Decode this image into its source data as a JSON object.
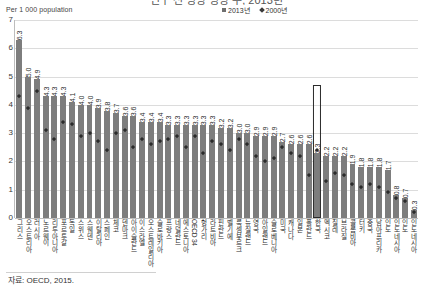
{
  "title_clipped": "인구 천 명당 병상 수, 2013년",
  "axis_unit_label": "Per 1 000 population",
  "legend": {
    "items": [
      {
        "label": "2013년",
        "marker": "square-swatch",
        "color": "#6f6f6f"
      },
      {
        "label": "2000년",
        "marker": "diamond-swatch",
        "color": "#3a3a3a"
      }
    ]
  },
  "source": "자료: OECD, 2015.",
  "highlight": {
    "category": "한국",
    "value": 2.3
  },
  "chart_data": {
    "type": "bar",
    "title": "인구 천 명당 병상 수, 2013년",
    "xlabel": "",
    "ylabel": "Per 1 000 population",
    "ylim": [
      0,
      7
    ],
    "yticks": [
      0,
      1,
      2,
      3,
      4,
      5,
      6,
      7
    ],
    "grid": true,
    "legend_position": "top-center",
    "categories": [
      "그리스",
      "오스트리아",
      "러시아",
      "노르웨이",
      "리투아니아",
      "포르투갈",
      "독일",
      "스위스",
      "스웨덴",
      "이탈리아",
      "스페인",
      "체코",
      "덴마크",
      "아이슬란드",
      "이스라엘",
      "오스트레일리아",
      "슬로바키아",
      "프랑스",
      "네덜란드",
      "에스토니아",
      "OECD 34",
      "헝가리",
      "라트비아",
      "핀란드",
      "벨기에",
      "룩셈부르크",
      "뉴질랜드",
      "영국",
      "아일랜드",
      "슬로베니아",
      "미국",
      "캐나다",
      "일본",
      "폴란드",
      "한국",
      "멕시코",
      "칠레",
      "브라질",
      "콜롬비아",
      "터키",
      "중국",
      "남아프리카",
      "인도",
      "인도네시아"
    ],
    "series": [
      {
        "name": "2013년",
        "type": "bar",
        "color": "#7d7d7d",
        "values": [
          6.3,
          5.0,
          4.9,
          4.3,
          4.3,
          4.3,
          4.1,
          4.0,
          4.0,
          3.9,
          3.8,
          3.7,
          3.6,
          3.6,
          3.4,
          3.4,
          3.4,
          3.3,
          3.3,
          3.3,
          3.3,
          3.3,
          3.3,
          3.2,
          3.2,
          3.0,
          3.0,
          2.9,
          2.9,
          2.9,
          2.7,
          2.6,
          2.6,
          2.6,
          2.3,
          2.2,
          2.2,
          2.2,
          1.9,
          1.8,
          1.8,
          1.8,
          1.7,
          0.8
        ]
      },
      {
        "name": "2000년",
        "type": "scatter",
        "color": "#2b2b2b",
        "values": [
          4.3,
          3.9,
          4.5,
          3.1,
          2.8,
          3.4,
          3.3,
          2.9,
          3.0,
          2.7,
          2.4,
          3.0,
          3.1,
          2.5,
          2.8,
          2.6,
          2.7,
          2.8,
          2.9,
          2.5,
          2.9,
          2.3,
          2.7,
          2.6,
          2.4,
          2.8,
          2.6,
          2.2,
          2.0,
          2.1,
          2.5,
          2.3,
          2.2,
          1.5,
          2.4,
          1.3,
          1.6,
          1.5,
          1.2,
          1.1,
          1.2,
          1.1,
          0.9,
          0.7
        ]
      }
    ],
    "extra_values": [
      0.7,
      0.3
    ],
    "extra_categories": [
      "인도",
      "인도네시아"
    ],
    "value_labels": [
      "6.3",
      "5.0",
      "4.9",
      "4.3",
      "4.3",
      "4.3",
      "4.1",
      "4.0",
      "4.0",
      "3.9",
      "3.8",
      "3.7",
      "3.6",
      "3.6",
      "3.4",
      "3.4",
      "3.4",
      "3.3",
      "3.3",
      "3.3",
      "3.3",
      "3.3",
      "3.3",
      "3.2",
      "3.2",
      "3.0",
      "3.0",
      "2.9",
      "2.9",
      "2.9",
      "2.7",
      "2.6",
      "2.6",
      "2.6",
      "2.3",
      "2.2",
      "2.2",
      "2.2",
      "1.9",
      "1.8",
      "1.8",
      "1.8",
      "1.7",
      "0.8"
    ]
  }
}
